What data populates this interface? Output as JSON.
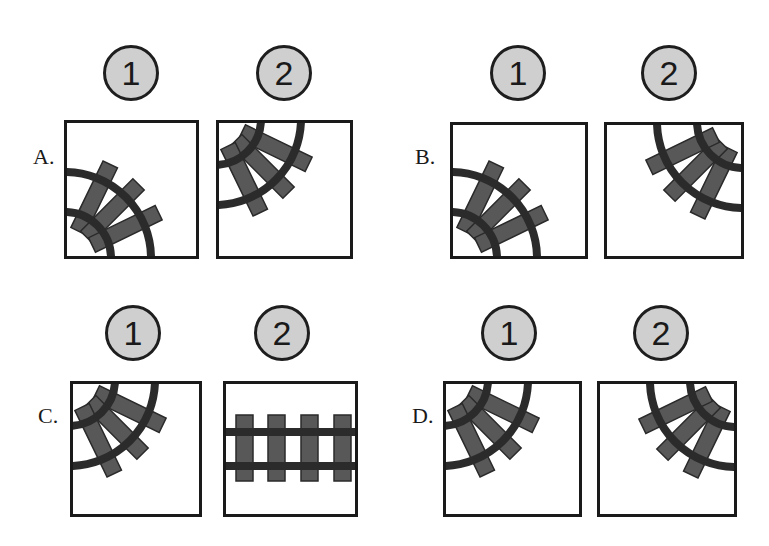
{
  "options": [
    {
      "label": "A.",
      "tiles": [
        {
          "number": "1",
          "track": "curve",
          "pivot": "bottom-left"
        },
        {
          "number": "2",
          "track": "curve",
          "pivot": "top-left"
        }
      ]
    },
    {
      "label": "B.",
      "tiles": [
        {
          "number": "1",
          "track": "curve",
          "pivot": "bottom-left"
        },
        {
          "number": "2",
          "track": "curve",
          "pivot": "top-right"
        }
      ]
    },
    {
      "label": "C.",
      "tiles": [
        {
          "number": "1",
          "track": "curve",
          "pivot": "top-left"
        },
        {
          "number": "2",
          "track": "straight",
          "pivot": "horizontal"
        }
      ]
    },
    {
      "label": "D.",
      "tiles": [
        {
          "number": "1",
          "track": "curve",
          "pivot": "top-left"
        },
        {
          "number": "2",
          "track": "curve",
          "pivot": "top-right"
        }
      ]
    }
  ],
  "colors": {
    "badge_fill": "#cfcfcf",
    "border": "#1a1a1a",
    "sleeper": "#585858",
    "rail": "#2b2b2b"
  }
}
